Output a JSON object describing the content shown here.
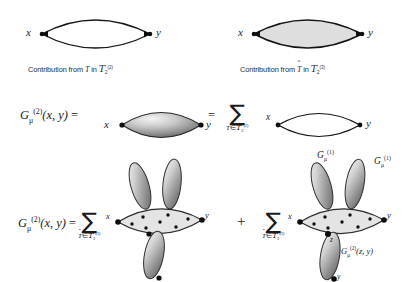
{
  "figure": {
    "type": "feynman-like-graph-expansion",
    "background_color": "#ffffff",
    "ink_color": "#1a1a1a"
  },
  "panel_top_left": {
    "name": "unshaded-lens-diagram",
    "left_node_label": "x",
    "right_node_label": "y",
    "lens_fill": "none",
    "caption_prefix": "Contribution from",
    "caption_symbol": "T",
    "caption_middle": "in",
    "caption_set": "T",
    "caption_set_sub": "2",
    "caption_set_sup": "(2)"
  },
  "panel_top_right": {
    "name": "shaded-lens-diagram",
    "left_node_label": "x",
    "right_node_label": "y",
    "lens_fill": "#dcdcdc",
    "caption_prefix": "Contribution from",
    "caption_symbol": "T",
    "caption_symbol_hat": true,
    "caption_middle": "in",
    "caption_set": "T",
    "caption_set_sub": "2",
    "caption_set_sup": "(3)"
  },
  "equation_row_1": {
    "name": "second-order-green-function-equation",
    "lhs": {
      "symbol": "G",
      "sub": "μ",
      "sup": "(2)",
      "args": "(x, y)"
    },
    "equals_1": "=",
    "term_1": {
      "name": "gradient-filled-lens",
      "left_node_label": "x",
      "right_node_label": "y",
      "fill": "gradient-gray"
    },
    "equals_2": "=",
    "sum": {
      "glyph": "∑",
      "subscript_member": "T",
      "subscript_in": "∈",
      "subscript_set": "T",
      "subscript_set_sub": "2",
      "subscript_set_sup": "(2)"
    },
    "term_2": {
      "name": "outline-lens",
      "left_node_label": "x",
      "right_node_label": "y",
      "fill": "none"
    }
  },
  "equation_row_2": {
    "name": "second-order-green-function-decomposition",
    "lhs": {
      "symbol": "G",
      "sub": "μ",
      "sup": "(2)",
      "args": "(x, y)"
    },
    "equals": "=",
    "sum_left": {
      "glyph": "∑",
      "subscript_member": "T",
      "subscript_member_hat": true,
      "subscript_in": "∈",
      "subscript_set": "T",
      "subscript_set_sub": "2",
      "subscript_set_sup": "(3)"
    },
    "graph_left": {
      "name": "three-lobe-dotted-backbone-graph",
      "left_node_label": "x",
      "right_node_label": "y",
      "lobes": 3,
      "backbone_fill": "#e2e2e2",
      "lobe_fill": "gradient-gray",
      "dot_count": 7
    },
    "plus": "+",
    "sum_right": {
      "glyph": "∑",
      "subscript_member": "T",
      "subscript_member_hat": true,
      "subscript_in": "∈",
      "subscript_set": "T",
      "subscript_set_sub": "2",
      "subscript_set_sup": "(3)"
    },
    "graph_right": {
      "name": "three-lobe-dotted-backbone-graph-labeled",
      "left_node_label": "x",
      "right_node_label": "y",
      "mid_node_label": "z",
      "lobes": 3,
      "backbone_fill": "#e2e2e2",
      "lobe_fill": "gradient-gray",
      "dot_count": 7,
      "label_lobe_1": {
        "symbol": "G",
        "sub": "μ",
        "sup": "(1)"
      },
      "label_lobe_2": {
        "symbol": "G",
        "sub": "μ",
        "sup": "(1)"
      },
      "label_lobe_3": {
        "symbol": "G",
        "sub": "μ",
        "sup": "(2)",
        "args": "(z, y)"
      }
    }
  }
}
